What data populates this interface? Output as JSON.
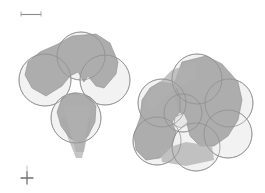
{
  "figure": {
    "background_color": "#ffffff",
    "width": 265,
    "height": 193,
    "sphere_fill_color": "#f1f1f1",
    "sphere_stroke_color": "#9a9a9a",
    "core_fill_color": "#a9a9a9",
    "core_stroke_color": "#8f8f8f"
  },
  "scale_bar": {
    "label": "",
    "unit_label": "",
    "x_start": 20,
    "x_end": 42,
    "y": 14,
    "tick_height": 5,
    "color": "#8a8a8a"
  },
  "axis_marker": {
    "label": "",
    "center_x": 27,
    "center_y": 177,
    "arm_length": 7,
    "color": "#6f6f6f"
  },
  "clusters": [
    {
      "name": "left-cluster",
      "label": "",
      "center_x": 72,
      "center_y": 90,
      "sphere_count": 4,
      "spheres": [
        {
          "id": "L1",
          "cx": 81,
          "cy": 56,
          "r": 24
        },
        {
          "id": "L2",
          "cx": 45,
          "cy": 80,
          "r": 26
        },
        {
          "id": "L3",
          "cx": 105,
          "cy": 80,
          "r": 25
        },
        {
          "id": "L4",
          "cx": 76,
          "cy": 118,
          "r": 25
        }
      ]
    },
    {
      "name": "right-cluster",
      "label": "",
      "center_x": 192,
      "center_y": 113,
      "sphere_count": 7,
      "spheres": [
        {
          "id": "R1",
          "cx": 197,
          "cy": 79,
          "r": 25
        },
        {
          "id": "R2",
          "cx": 162,
          "cy": 103,
          "r": 24
        },
        {
          "id": "R3",
          "cx": 229,
          "cy": 103,
          "r": 24
        },
        {
          "id": "R4",
          "cx": 157,
          "cy": 141,
          "r": 24
        },
        {
          "id": "R5",
          "cx": 196,
          "cy": 147,
          "r": 24
        },
        {
          "id": "R6",
          "cx": 228,
          "cy": 134,
          "r": 24
        },
        {
          "id": "R7",
          "cx": 183,
          "cy": 113,
          "r": 19
        }
      ]
    }
  ]
}
